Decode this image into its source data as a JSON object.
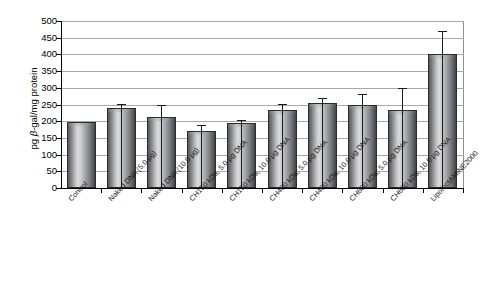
{
  "chart_data": {
    "type": "bar",
    "title": "",
    "xlabel": "",
    "ylabel": "pg β-gal/mg protein",
    "ylabel_prefix": "pg ",
    "ylabel_italic": "β",
    "ylabel_suffix": "-gal/mg protein",
    "ylim": [
      0,
      500
    ],
    "ytick_step": 50,
    "yticks": [
      500,
      450,
      400,
      350,
      300,
      250,
      200,
      150,
      100,
      50,
      0
    ],
    "ytick_labels": [
      "500",
      "450",
      "400",
      "350",
      "300",
      "250",
      "200",
      "150",
      "100",
      "50",
      "0"
    ],
    "grid": true,
    "grid_axis": "y",
    "legend": false,
    "legend_position": "none",
    "categories": [
      "Control",
      "Naked DNA (5.0 µg)",
      "Naked DNA (10.0 µg)",
      "CH150 kDa, 5.0 µg DNA",
      "CH150 kDa, 10.0 µg DNA",
      "CH400 kDa, 5.0 µg DNA",
      "CH400 kDa, 10.0 µg DNA",
      "CH600 kDa, 5.0 µg DNA",
      "CH600 kDa, 10.0 µg DNA",
      "LipofectAMINE2000"
    ],
    "values": [
      198,
      240,
      212,
      170,
      195,
      235,
      255,
      250,
      235,
      400
    ],
    "errors": [
      0,
      12,
      38,
      20,
      10,
      18,
      15,
      32,
      65,
      70
    ],
    "bar_color": "#8c8e92",
    "bar_edge_color": "#2b2c2f",
    "error_bar_color": "#1a1a1a",
    "gridline_color": "#a8a8a8",
    "axis_color": "#000000",
    "background_color": "#ffffff"
  }
}
